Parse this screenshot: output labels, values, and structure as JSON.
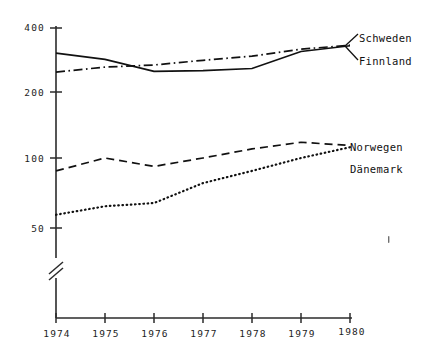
{
  "chart_data": {
    "type": "line",
    "title": "",
    "xlabel": "",
    "ylabel": "",
    "scale": "logarithmic",
    "axis_break": true,
    "grid": false,
    "legend_position": "right-inline",
    "x": [
      1974,
      1975,
      1976,
      1977,
      1978,
      1979,
      1980
    ],
    "xticklabels": [
      "1974",
      "1975",
      "1976",
      "1977",
      "1978",
      "1979",
      "1980"
    ],
    "yticklabels": [
      "400",
      "200",
      "100",
      "50"
    ],
    "yticks": [
      400,
      200,
      100,
      50
    ],
    "ylim": [
      40,
      400
    ],
    "series": [
      {
        "name": "Schweden",
        "style": "solid",
        "values": [
          305,
          285,
          250,
          252,
          258,
          310,
          330
        ]
      },
      {
        "name": "Finnland",
        "style": "dash-dot",
        "values": [
          248,
          262,
          268,
          282,
          295,
          318,
          332
        ]
      },
      {
        "name": "Norwegen",
        "style": "dashed",
        "values": [
          88,
          100,
          92,
          100,
          110,
          118,
          114
        ]
      },
      {
        "name": "Dänemark",
        "style": "dotted",
        "values": [
          57,
          62,
          64,
          78,
          88,
          100,
          112
        ]
      }
    ]
  },
  "axes": {
    "y_labels": [
      "400",
      "200",
      "100",
      "50"
    ],
    "x_labels": [
      "1974",
      "1975",
      "1976",
      "1977",
      "1978",
      "1979",
      "1980"
    ]
  },
  "legend": {
    "items": [
      {
        "label": "Schweden"
      },
      {
        "label": "Finnland"
      },
      {
        "label": "Norwegen"
      },
      {
        "label": "Dänemark"
      }
    ]
  }
}
